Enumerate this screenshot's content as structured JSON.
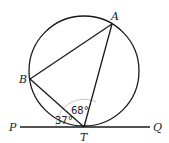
{
  "diagram": {
    "type": "circle-geometry",
    "points": {
      "A": {
        "label": "A"
      },
      "B": {
        "label": "B"
      },
      "T": {
        "label": "T"
      },
      "P": {
        "label": "P"
      },
      "Q": {
        "label": "Q"
      }
    },
    "angles": {
      "BTP": {
        "label": "37°",
        "value": 37
      },
      "ATB": {
        "label": "68°",
        "value": 68
      }
    },
    "elements": [
      "circle",
      "chord AB",
      "chord BT",
      "chord AT",
      "tangent PQ at T"
    ],
    "colors": {
      "stroke": "#1a1a1a",
      "arc": "#bbbbbb",
      "background": "#ffffff"
    }
  }
}
